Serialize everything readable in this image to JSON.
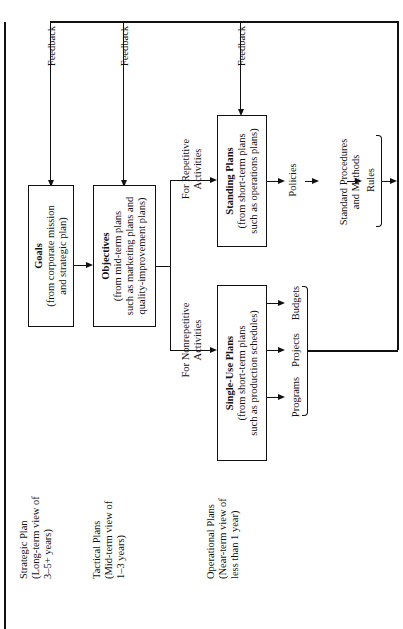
{
  "levels": [
    {
      "title": "Strategic Plan",
      "detail": "(Long-term view of",
      "detail2": "3–5+ years)"
    },
    {
      "title": "Tactical Plans",
      "detail": "(Mid-term view of",
      "detail2": "1–3 years)"
    },
    {
      "title": "Operational Plans",
      "detail": "(Near-term view of",
      "detail2": "less than 1 year)"
    }
  ],
  "boxes": {
    "goals": {
      "title": "Goals",
      "line1": "(from corporate mission",
      "line2": "and strategic plan)"
    },
    "objectives": {
      "title": "Objectives",
      "line1": "(from mid-term plans",
      "line2": "such as marketing plans and",
      "line3": "quality-improvement plans)"
    },
    "standing": {
      "title": "Standing Plans",
      "line1": "(from short-term plans",
      "line2": "such as operations plans)"
    },
    "single_use": {
      "title": "Single-Use Plans",
      "line1": "(from short-term plans",
      "line2": "such as production schedules)"
    }
  },
  "branches": {
    "repetitive": {
      "line1": "For Repetitive",
      "line2": "Activities"
    },
    "nonrepetitive": {
      "line1": "For Nonrepetitive",
      "line2": "Activities"
    }
  },
  "standing_outputs": {
    "policies": "Policies",
    "procedures_line1": "Standard Procedures",
    "procedures_line2": "and Methods",
    "rules": "Rules"
  },
  "single_use_outputs": [
    "Programs",
    "Projects",
    "Budgets"
  ],
  "feedback": [
    "Feedback",
    "Feedback",
    "Feedback"
  ]
}
